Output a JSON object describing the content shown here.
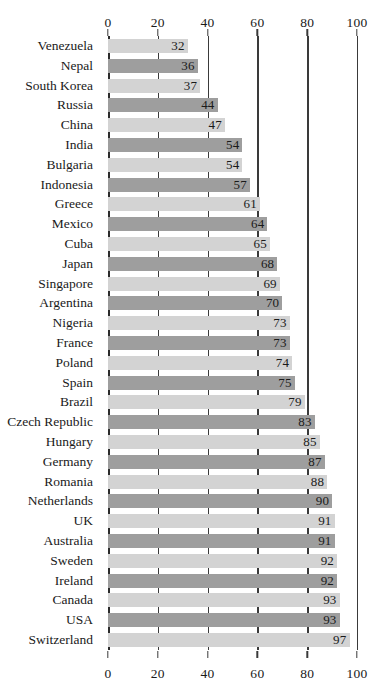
{
  "chart_data": {
    "type": "bar",
    "orientation": "horizontal",
    "title": "",
    "subtitle": "",
    "xlabel": "",
    "ylabel": "",
    "xlim": [
      0,
      100
    ],
    "xticks": [
      0,
      20,
      40,
      60,
      80,
      100
    ],
    "xtick_labels": [
      "0",
      "20",
      "40",
      "60",
      "80",
      "100"
    ],
    "grid": true,
    "grid_axis": "x",
    "legend": false,
    "legend_position": "none",
    "axis_position": "both",
    "categories": [
      "Venezuela",
      "Nepal",
      "South Korea",
      "Russia",
      "China",
      "India",
      "Bulgaria",
      "Indonesia",
      "Greece",
      "Mexico",
      "Cuba",
      "Japan",
      "Singapore",
      "Argentina",
      "Nigeria",
      "France",
      "Poland",
      "Spain",
      "Brazil",
      "Czech Republic",
      "Hungary",
      "Germany",
      "Romania",
      "Netherlands",
      "UK",
      "Australia",
      "Sweden",
      "Ireland",
      "Canada",
      "USA",
      "Switzerland"
    ],
    "values": [
      32,
      36,
      37,
      44,
      47,
      54,
      54,
      57,
      61,
      64,
      65,
      68,
      69,
      70,
      73,
      73,
      74,
      75,
      79,
      83,
      85,
      87,
      88,
      90,
      91,
      91,
      92,
      92,
      93,
      93,
      97
    ],
    "bar_shades": [
      "light",
      "dark",
      "light",
      "dark",
      "light",
      "dark",
      "light",
      "dark",
      "light",
      "dark",
      "light",
      "dark",
      "light",
      "dark",
      "light",
      "dark",
      "light",
      "dark",
      "light",
      "dark",
      "light",
      "dark",
      "light",
      "dark",
      "light",
      "dark",
      "light",
      "dark",
      "light",
      "dark",
      "light"
    ],
    "colors": {
      "bar_light": "#d3d3d3",
      "bar_dark": "#9e9e9e",
      "gridline": "#3a3a3a",
      "axis": "#2b2b2b",
      "text": "#1a1a1a",
      "background": "#ffffff"
    }
  }
}
